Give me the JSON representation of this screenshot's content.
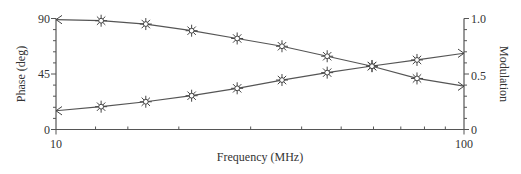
{
  "chart_data": {
    "type": "line",
    "title": "",
    "xlabel": "Frequency (MHz)",
    "ylabel": "Phase (deg)",
    "y2label": "Modulation",
    "xscale": "log",
    "xlim": [
      10,
      100
    ],
    "ylim": [
      0,
      90
    ],
    "y2lim": [
      0,
      1.0
    ],
    "x_tick_labels": [
      "10",
      "100"
    ],
    "y_tick_labels": [
      "0",
      "45",
      "90"
    ],
    "y2_tick_labels": [
      "0",
      "0.5",
      "1.0"
    ],
    "grid": false,
    "legend": null,
    "x": [
      10,
      12.9,
      16.6,
      21.5,
      27.8,
      35.8,
      46.2,
      59.5,
      76.7,
      100
    ],
    "series": [
      {
        "name": "Phase",
        "axis": "left",
        "values": [
          15.2,
          18.5,
          22.5,
          27.4,
          33.4,
          40.1,
          46.1,
          51.5,
          56.4,
          61.8
        ],
        "markers_on_points": [
          false,
          true,
          true,
          true,
          true,
          true,
          true,
          true,
          true,
          false
        ]
      },
      {
        "name": "Modulation",
        "axis": "right",
        "values": [
          0.99,
          0.98,
          0.95,
          0.89,
          0.82,
          0.75,
          0.66,
          0.57,
          0.46,
          0.39
        ],
        "markers_on_points": [
          false,
          true,
          true,
          true,
          true,
          true,
          true,
          true,
          true,
          false
        ]
      }
    ]
  },
  "labels": {
    "xlabel": "Frequency (MHz)",
    "ylabel": "Phase (deg)",
    "y2label": "Modulation",
    "x_min": "10",
    "x_max": "100",
    "y_0": "0",
    "y_45": "45",
    "y_90": "90",
    "y2_0": "0",
    "y2_05": "0.5",
    "y2_10": "1.0"
  },
  "colors": {
    "line": "#555555",
    "text": "#333333",
    "background": "#ffffff"
  }
}
